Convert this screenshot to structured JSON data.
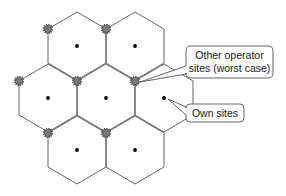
{
  "diagram": {
    "type": "hexagonal-cell-layout",
    "line_color": "#555555",
    "own_site_color": "#000000",
    "other_site_fill": "#7a7a7a",
    "other_site_stroke": "#333333",
    "cells": [
      {
        "row": 1,
        "cx": 77,
        "cy": 46
      },
      {
        "row": 1,
        "cx": 135,
        "cy": 46
      },
      {
        "row": 2,
        "cx": 48,
        "cy": 98
      },
      {
        "row": 2,
        "cx": 106,
        "cy": 98
      },
      {
        "row": 2,
        "cx": 164,
        "cy": 98
      },
      {
        "row": 3,
        "cx": 77,
        "cy": 150
      },
      {
        "row": 3,
        "cx": 135,
        "cy": 150
      }
    ],
    "other_operator_sites": [
      {
        "x": 48,
        "y": 29
      },
      {
        "x": 106,
        "y": 29
      },
      {
        "x": 19,
        "y": 81
      },
      {
        "x": 77,
        "y": 81
      },
      {
        "x": 135,
        "y": 81
      },
      {
        "x": 48,
        "y": 133
      },
      {
        "x": 106,
        "y": 133
      }
    ],
    "callouts": [
      {
        "id": "other-operator-sites",
        "lines": [
          "Other operator",
          "sites (worst case)"
        ],
        "box": {
          "x": 186,
          "y": 46,
          "w": 87,
          "h": 32
        },
        "target": {
          "x": 140,
          "y": 82
        }
      },
      {
        "id": "own-sites",
        "lines": [
          "Own sites"
        ],
        "box": {
          "x": 186,
          "y": 104,
          "w": 58,
          "h": 18
        },
        "target": {
          "x": 168,
          "y": 99
        }
      }
    ]
  }
}
